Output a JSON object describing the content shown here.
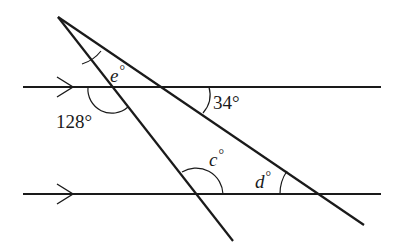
{
  "diagram": {
    "type": "geometry-parallel-lines-with-transversals",
    "parallel_lines": [
      {
        "name": "top",
        "marker": "arrow"
      },
      {
        "name": "bottom",
        "marker": "arrow"
      }
    ],
    "transversals": 2,
    "labels": {
      "e": {
        "var": "e",
        "deg": "°"
      },
      "a128": {
        "text": "128°"
      },
      "a34": {
        "text": "34°"
      },
      "c": {
        "var": "c",
        "deg": "°"
      },
      "d": {
        "var": "d",
        "deg": "°"
      }
    }
  }
}
